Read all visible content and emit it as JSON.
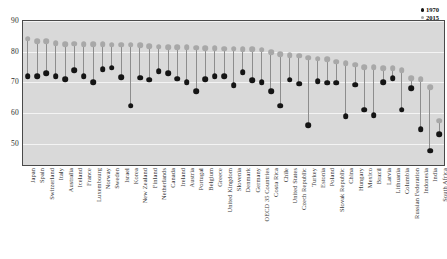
{
  "chart_data": {
    "type": "scatter",
    "title": "",
    "subtitle": "",
    "xlabel": "",
    "ylabel": "Years",
    "ylim": [
      43,
      90
    ],
    "yticks": [
      50,
      60,
      70,
      80,
      90
    ],
    "grid": true,
    "legend_position": "top-right",
    "categories": [
      "Japan",
      "Spain",
      "Switzerland",
      "Italy",
      "Australia",
      "Iceland",
      "France",
      "Luxembourg",
      "Norway",
      "Sweden",
      "Israel",
      "Korea",
      "New Zealand",
      "Finland",
      "Netherlands",
      "Canada",
      "Ireland",
      "Austria",
      "Portugal",
      "Belgium",
      "Greece",
      "United Kingdom",
      "Slovenia",
      "Denmark",
      "Germany",
      "OECD 35 Countries",
      "Costa Rica",
      "Chile",
      "United States",
      "Czech Republic",
      "Turkey",
      "Estonia",
      "Poland",
      "Slovak Republic",
      "China",
      "Hungary",
      "Mexico",
      "Brazil",
      "Latvia",
      "Lithuania",
      "Columbia",
      "Russian Federation",
      "Indonesia",
      "India",
      "South Africa"
    ],
    "series": [
      {
        "name": "1970",
        "color": "#151515",
        "values": [
          72.0,
          72.0,
          73.0,
          72.0,
          71.0,
          74.0,
          72.0,
          70.0,
          74.3,
          74.7,
          71.6,
          62.3,
          71.5,
          70.8,
          73.6,
          72.9,
          71.2,
          70.0,
          67.0,
          71.0,
          72.0,
          71.9,
          69.0,
          73.3,
          70.6,
          70.0,
          67.0,
          62.4,
          70.8,
          69.6,
          56.0,
          70.3,
          69.9,
          69.8,
          59.0,
          69.2,
          61.0,
          59.2,
          70.0,
          71.3,
          61.0,
          68.1,
          54.7,
          47.7,
          53.0
        ]
      },
      {
        "name": "2015",
        "color": "#a8a8a8",
        "values": [
          84.2,
          83.4,
          83.4,
          82.7,
          82.5,
          82.6,
          82.4,
          82.4,
          82.4,
          82.3,
          82.2,
          82.2,
          82.1,
          81.7,
          81.6,
          81.5,
          81.5,
          81.4,
          81.3,
          81.2,
          81.1,
          81.0,
          81.0,
          80.8,
          80.7,
          80.6,
          79.8,
          79.1,
          78.8,
          78.7,
          78.0,
          77.7,
          77.5,
          76.7,
          76.3,
          75.7,
          75.0,
          75.0,
          74.6,
          74.5,
          74.0,
          71.3,
          71.0,
          68.3,
          57.4
        ]
      }
    ],
    "legend": [
      "1970",
      "2015"
    ]
  }
}
